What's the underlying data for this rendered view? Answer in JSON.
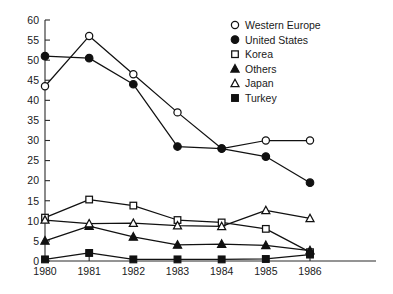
{
  "chart_data": {
    "type": "line",
    "title": "",
    "subtitle": "",
    "xlabel": "",
    "ylabel": "",
    "x": [
      1980,
      1981,
      1982,
      1983,
      1984,
      1985,
      1986
    ],
    "categories": [
      "1980",
      "1981",
      "1982",
      "1983",
      "1984",
      "1985",
      "1986"
    ],
    "xlim": [
      1980,
      1986
    ],
    "ylim": [
      0,
      60
    ],
    "ytick_labels": [
      "0",
      "5",
      "10",
      "15",
      "20",
      "25",
      "30",
      "35",
      "40",
      "45",
      "50",
      "55",
      "60"
    ],
    "ytick_values": [
      0,
      5,
      10,
      15,
      20,
      25,
      30,
      35,
      40,
      45,
      50,
      55,
      60
    ],
    "xtick_labels": [
      "1980",
      "1981",
      "1982",
      "1983",
      "1984",
      "1985",
      "1986"
    ],
    "grid": false,
    "legend_position": "top-right",
    "series": [
      {
        "name": "Western Europe",
        "marker": "open-circle",
        "values": [
          43.5,
          56,
          46.5,
          37,
          28,
          30,
          30
        ]
      },
      {
        "name": "United States",
        "marker": "filled-circle",
        "values": [
          51,
          50.5,
          44,
          28.5,
          28,
          26,
          19.5
        ]
      },
      {
        "name": "Korea",
        "marker": "open-square",
        "values": [
          10.8,
          15.3,
          13.8,
          10.2,
          9.6,
          8,
          2.2
        ]
      },
      {
        "name": "Others",
        "marker": "filled-triangle",
        "values": [
          5,
          8.7,
          6,
          4,
          4.2,
          3.9,
          2.6
        ]
      },
      {
        "name": "Japan",
        "marker": "open-triangle",
        "values": [
          10.2,
          9.3,
          9.4,
          8.8,
          8.6,
          12.6,
          10.6
        ]
      },
      {
        "name": "Turkey",
        "marker": "filled-square",
        "values": [
          0.4,
          2.0,
          0.4,
          0.4,
          0.4,
          0.5,
          1.6
        ]
      }
    ]
  },
  "legend": {
    "items": [
      {
        "label": "Western Europe",
        "marker": "open-circle"
      },
      {
        "label": "United States",
        "marker": "filled-circle"
      },
      {
        "label": "Korea",
        "marker": "open-square"
      },
      {
        "label": "Others",
        "marker": "filled-triangle"
      },
      {
        "label": "Japan",
        "marker": "open-triangle"
      },
      {
        "label": "Turkey",
        "marker": "filled-square"
      }
    ]
  },
  "colors": {
    "ink": "#111111",
    "axis": "#2b2b2b",
    "background": "#ffffff"
  }
}
